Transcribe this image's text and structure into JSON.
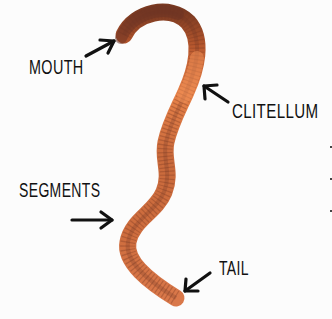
{
  "diagram": {
    "labels": {
      "mouth": "MOUTH",
      "clitellum": "CLITELLUM",
      "segments": "SEGMENTS",
      "tail": "TAIL"
    },
    "colors": {
      "background": "#fcfcfc",
      "worm_body": "#d2733f",
      "worm_dark": "#7a3a22",
      "worm_head": "#6b3324",
      "clitellum": "#e8834a",
      "segment_lines": "#8c4626",
      "arrow": "#111111",
      "label_text": "#111111"
    }
  }
}
